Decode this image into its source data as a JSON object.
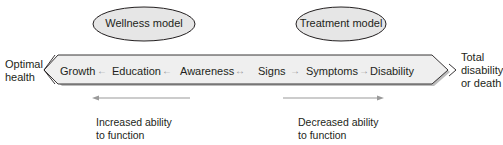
{
  "ellipses": {
    "wellness": "Wellness model",
    "treatment": "Treatment model"
  },
  "left_label": {
    "line1": "Optimal",
    "line2": "health"
  },
  "right_label": {
    "line1": "Total",
    "line2": "disability",
    "line3": "or death"
  },
  "continuum": {
    "items": [
      "Growth",
      "Education",
      "Awareness",
      "Signs",
      "Symptoms",
      "Disability"
    ],
    "arrows": [
      "←",
      "←",
      "↔",
      "→",
      "→"
    ]
  },
  "bottom": {
    "left": {
      "direction": "left",
      "line1": "Increased ability",
      "line2": "to function"
    },
    "right": {
      "direction": "right",
      "line1": "Decreased ability",
      "line2": "to function"
    }
  },
  "colors": {
    "ellipse_fill": "#e6e6e6",
    "band_fill": "#efefef",
    "stroke": "#231f20",
    "arrow_gray": "#9a9a9a"
  }
}
